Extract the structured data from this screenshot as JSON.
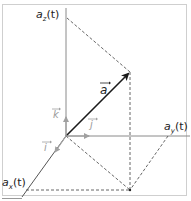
{
  "diagram": {
    "labels": {
      "az": "a",
      "az_sub": "z",
      "az_arg": "(t)",
      "ay": "a",
      "ay_sub": "y",
      "ay_arg": "(t)",
      "ax": "a",
      "ax_sub": "x",
      "ax_arg": "(t)",
      "vector": "a",
      "unit_i": "i",
      "unit_j": "j",
      "unit_k": "k"
    },
    "colors": {
      "axis": "#8a8a8a",
      "vector": "#1a1a1a",
      "dashed": "#555555",
      "unit_vectors": "#a0a0a0",
      "frame": "#cfcfcf"
    },
    "geometry": {
      "origin": [
        66,
        136
      ],
      "vector_tip": [
        130,
        72
      ],
      "projection_xy": [
        130,
        190
      ],
      "az_point": [
        66,
        18
      ],
      "ay_point": [
        168,
        136
      ],
      "ax_point": [
        26,
        190
      ]
    }
  }
}
